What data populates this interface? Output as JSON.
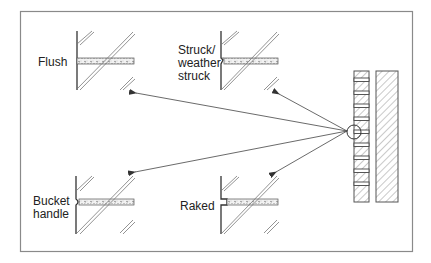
{
  "diagram": {
    "title": "",
    "frame_color": "#8a8a8a",
    "line_color": "#333333",
    "joints": [
      {
        "id": "flush",
        "label": "Flush"
      },
      {
        "id": "struck",
        "label": "Struck/\nweather\nstruck",
        "lines": [
          "Struck/",
          "weather",
          "struck"
        ]
      },
      {
        "id": "bucket",
        "label": "Bucket\nhandle",
        "lines": [
          "Bucket",
          "handle"
        ]
      },
      {
        "id": "raked",
        "label": "Raked"
      }
    ],
    "wall": {
      "description": "brick wall section with detail circle"
    }
  }
}
